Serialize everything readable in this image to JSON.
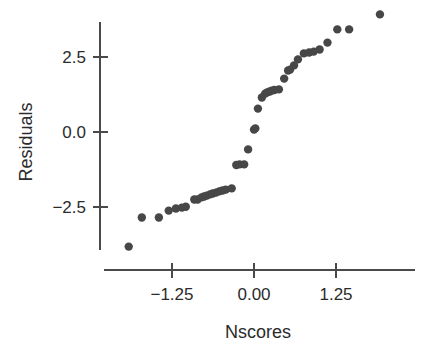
{
  "chart_data": {
    "type": "scatter",
    "title": "",
    "xlabel": "Nscores",
    "ylabel": "Residuals",
    "xticks": [
      -1.25,
      0.0,
      1.25
    ],
    "xtick_labels": [
      "−1.25",
      "0.00",
      "1.25"
    ],
    "yticks": [
      2.5,
      0.0,
      -2.5
    ],
    "ytick_labels": [
      "2.5",
      "0.0",
      "−2.5"
    ],
    "xlim": [
      -2.05,
      2.45
    ],
    "ylim": [
      -4.4,
      4.4
    ],
    "grid": false,
    "legend": null,
    "marker_color": "#474747",
    "marker_size": 6.2,
    "axis_color": "#4a4a4a",
    "background_color": "#ffffff",
    "series": [
      {
        "name": "residuals-vs-nscores",
        "points": [
          [
            -1.91,
            -3.82
          ],
          [
            -1.71,
            -2.85
          ],
          [
            -1.45,
            -2.85
          ],
          [
            -1.3,
            -2.62
          ],
          [
            -1.19,
            -2.55
          ],
          [
            -1.1,
            -2.52
          ],
          [
            -1.04,
            -2.49
          ],
          [
            -0.91,
            -2.25
          ],
          [
            -0.86,
            -2.25
          ],
          [
            -0.8,
            -2.18
          ],
          [
            -0.76,
            -2.15
          ],
          [
            -0.72,
            -2.12
          ],
          [
            -0.67,
            -2.08
          ],
          [
            -0.63,
            -2.05
          ],
          [
            -0.58,
            -2.02
          ],
          [
            -0.53,
            -1.98
          ],
          [
            -0.48,
            -1.95
          ],
          [
            -0.43,
            -1.92
          ],
          [
            -0.34,
            -1.88
          ],
          [
            -0.27,
            -1.1
          ],
          [
            -0.22,
            -1.08
          ],
          [
            -0.15,
            -1.08
          ],
          [
            -0.09,
            -0.58
          ],
          [
            0.0,
            0.08
          ],
          [
            0.02,
            0.12
          ],
          [
            0.06,
            0.78
          ],
          [
            0.12,
            1.15
          ],
          [
            0.17,
            1.28
          ],
          [
            0.2,
            1.32
          ],
          [
            0.24,
            1.35
          ],
          [
            0.27,
            1.38
          ],
          [
            0.31,
            1.4
          ],
          [
            0.38,
            1.42
          ],
          [
            0.46,
            1.78
          ],
          [
            0.52,
            2.05
          ],
          [
            0.55,
            2.08
          ],
          [
            0.61,
            2.22
          ],
          [
            0.67,
            2.42
          ],
          [
            0.76,
            2.62
          ],
          [
            0.84,
            2.65
          ],
          [
            0.91,
            2.68
          ],
          [
            1.0,
            2.75
          ],
          [
            1.12,
            2.98
          ],
          [
            1.27,
            3.42
          ],
          [
            1.45,
            3.42
          ],
          [
            1.92,
            3.92
          ]
        ]
      }
    ]
  }
}
